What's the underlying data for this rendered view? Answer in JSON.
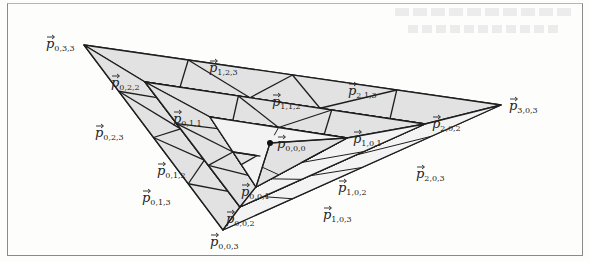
{
  "figure": {
    "type": "nested-triangle-control-net",
    "colors": {
      "stroke": "#1e1e1e",
      "fill_light": "#f3f3f3",
      "fill_shade": "#e2e2e2",
      "frame": "#8a8a8a"
    },
    "levels": [
      {
        "name": "level-3",
        "corners": {
          "a": [
            84,
            45
          ],
          "b": [
            501,
            105
          ],
          "c": [
            223,
            230
          ]
        },
        "corner_labels": [
          "p0,3,3",
          "p3,0,3",
          "p0,0,3"
        ]
      },
      {
        "name": "level-2",
        "corners": {
          "a": [
            145,
            82
          ],
          "b": [
            425,
            124
          ],
          "c": [
            240,
            207
          ]
        },
        "corner_labels": [
          "p0,2,2",
          "p2,0,2",
          "p0,0,2"
        ]
      },
      {
        "name": "level-1",
        "corners": {
          "a": [
            210,
            117
          ],
          "b": [
            347,
            138
          ],
          "c": [
            256,
            187
          ]
        },
        "corner_labels": [
          "p0,1,1",
          "p1,0,1",
          "p0,0,1"
        ]
      }
    ],
    "apex": {
      "pos": [
        270,
        143
      ],
      "label": "p0,0,0"
    },
    "labels": [
      {
        "id": "p033",
        "base": "p",
        "sub": "0,3,3",
        "x": 46,
        "y": 48
      },
      {
        "id": "p123",
        "base": "p",
        "sub": "1,2,3",
        "x": 209,
        "y": 72
      },
      {
        "id": "p213",
        "base": "p",
        "sub": "2,1,3",
        "x": 348,
        "y": 95
      },
      {
        "id": "p303",
        "base": "p",
        "sub": "3,0,3",
        "x": 509,
        "y": 110
      },
      {
        "id": "p022",
        "base": "p",
        "sub": "0,2,2",
        "x": 111,
        "y": 87
      },
      {
        "id": "p112",
        "base": "p",
        "sub": "1,1,2",
        "x": 272,
        "y": 106
      },
      {
        "id": "p202",
        "base": "p",
        "sub": "2,0,2",
        "x": 432,
        "y": 128
      },
      {
        "id": "p011",
        "base": "p",
        "sub": "0,1,1",
        "x": 173,
        "y": 123
      },
      {
        "id": "p101",
        "base": "p",
        "sub": "1,0,1",
        "x": 353,
        "y": 143
      },
      {
        "id": "p000",
        "base": "p",
        "sub": "0,0,0",
        "x": 277,
        "y": 148
      },
      {
        "id": "p023",
        "base": "p",
        "sub": "0,2,3",
        "x": 95,
        "y": 137
      },
      {
        "id": "p012",
        "base": "p",
        "sub": "0,1,2",
        "x": 157,
        "y": 175
      },
      {
        "id": "p013",
        "base": "p",
        "sub": "0,1,3",
        "x": 142,
        "y": 202
      },
      {
        "id": "p001",
        "base": "p",
        "sub": "0,0,1",
        "x": 241,
        "y": 196
      },
      {
        "id": "p102",
        "base": "p",
        "sub": "1,0,2",
        "x": 338,
        "y": 192
      },
      {
        "id": "p203",
        "base": "p",
        "sub": "2,0,3",
        "x": 416,
        "y": 178
      },
      {
        "id": "p002",
        "base": "p",
        "sub": "0,0,2",
        "x": 226,
        "y": 223
      },
      {
        "id": "p103",
        "base": "p",
        "sub": "1,0,3",
        "x": 323,
        "y": 219
      },
      {
        "id": "p003",
        "base": "p",
        "sub": "0,0,3",
        "x": 210,
        "y": 246
      }
    ],
    "bleed_text": [
      "show-through text (illegible)",
      "show-through text (illegible)"
    ]
  }
}
